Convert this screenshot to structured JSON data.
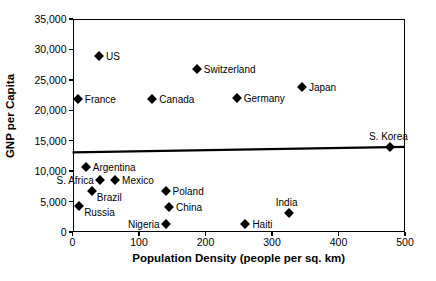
{
  "chart_data": {
    "type": "scatter",
    "title": "",
    "xlabel": "Population Density (people per sq. km)",
    "ylabel": "GNP per Capita",
    "xlim": [
      0,
      500
    ],
    "ylim": [
      0,
      35000
    ],
    "xticks": [
      0,
      100,
      200,
      300,
      400,
      500
    ],
    "xtick_labels": [
      "0",
      "100",
      "200",
      "300",
      "400",
      "500"
    ],
    "yticks": [
      0,
      5000,
      10000,
      15000,
      20000,
      25000,
      30000,
      35000
    ],
    "ytick_labels": [
      "0",
      "5,000",
      "10,000",
      "15,000",
      "20,000",
      "25,000",
      "30,000",
      "35,000"
    ],
    "grid": false,
    "legend": "none",
    "marker_shape": "diamond",
    "marker_color": "#000000",
    "points": [
      {
        "label": "US",
        "x": 40,
        "y": 29000,
        "label_side": "right"
      },
      {
        "label": "Switzerland",
        "x": 187,
        "y": 26800,
        "label_side": "right"
      },
      {
        "label": "Japan",
        "x": 345,
        "y": 23800,
        "label_side": "right"
      },
      {
        "label": "France",
        "x": 8,
        "y": 21800,
        "label_side": "right"
      },
      {
        "label": "Canada",
        "x": 120,
        "y": 21800,
        "label_side": "right"
      },
      {
        "label": "Germany",
        "x": 247,
        "y": 22000,
        "label_side": "right"
      },
      {
        "label": "S. Korea",
        "x": 478,
        "y": 14000,
        "label_side": "above"
      },
      {
        "label": "Argentina",
        "x": 20,
        "y": 10700,
        "label_side": "right"
      },
      {
        "label": "S. Africa",
        "x": 41,
        "y": 8500,
        "label_side": "left"
      },
      {
        "label": "Mexico",
        "x": 64,
        "y": 8500,
        "label_side": "right"
      },
      {
        "label": "Brazil",
        "x": 29,
        "y": 6700,
        "label_side": "below-right"
      },
      {
        "label": "Poland",
        "x": 140,
        "y": 6700,
        "label_side": "right"
      },
      {
        "label": "Russia",
        "x": 10,
        "y": 4300,
        "label_side": "below-right"
      },
      {
        "label": "China",
        "x": 145,
        "y": 4100,
        "label_side": "right"
      },
      {
        "label": "India",
        "x": 325,
        "y": 3100,
        "label_side": "above"
      },
      {
        "label": "Nigeria",
        "x": 140,
        "y": 1300,
        "label_side": "left"
      },
      {
        "label": "Haiti",
        "x": 260,
        "y": 1300,
        "label_side": "right"
      }
    ],
    "trendline": {
      "x_start": 0,
      "y_start": 13100,
      "x_end": 500,
      "y_end": 14000,
      "color": "#000000"
    }
  }
}
